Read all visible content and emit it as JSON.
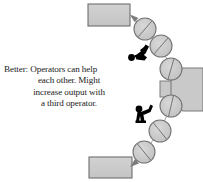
{
  "diagram": {
    "type": "u-shaped-work-cell",
    "caption": {
      "lines": [
        "Better: Operators can help",
        "each other. Might",
        "increase output with",
        "a third operator."
      ],
      "full_text": "Better: Operators can help each other. Might increase output with a third operator."
    },
    "colors": {
      "fill_gray": "#c9c9c9",
      "fill_gray_light": "#cfcfcf",
      "outline": "#6e6e6e",
      "outline_dark": "#555555",
      "operator": "#000000",
      "arrow": "#8a8a8a",
      "text": "#1a1a1a",
      "background": "#ffffff"
    },
    "boxes": [
      {
        "name": "input-box-top",
        "x": 88,
        "y": 4,
        "w": 42,
        "h": 22
      },
      {
        "name": "output-box-bottom",
        "x": 89,
        "y": 157,
        "w": 43,
        "h": 21
      }
    ],
    "machine_block": {
      "name": "machine-block-right",
      "x": 168,
      "y": 72,
      "w": 35,
      "h": 34,
      "tab": {
        "x": 160,
        "y": 82,
        "w": 12,
        "h": 15
      }
    },
    "workstations": [
      {
        "id": 1,
        "cx": 145,
        "cy": 29,
        "r": 11
      },
      {
        "id": 2,
        "cx": 161,
        "cy": 46,
        "r": 11
      },
      {
        "id": 3,
        "cx": 171,
        "cy": 69,
        "r": 11
      },
      {
        "id": 4,
        "cx": 171,
        "cy": 106,
        "r": 11
      },
      {
        "id": 5,
        "cx": 160,
        "cy": 131,
        "r": 11
      },
      {
        "id": 6,
        "cx": 144,
        "cy": 152,
        "r": 11
      }
    ],
    "operators": [
      {
        "id": "operator-1",
        "x": 129,
        "y": 45,
        "label": "operator"
      },
      {
        "id": "operator-2",
        "x": 136,
        "y": 106,
        "label": "operator"
      }
    ],
    "flow_arrows": [
      {
        "name": "arrow-to-input-box",
        "from": [
          136,
          22
        ],
        "to": [
          130,
          15
        ]
      },
      {
        "name": "arrow-to-output-box",
        "from": [
          137,
          161
        ],
        "to": [
          130,
          167
        ]
      }
    ]
  }
}
